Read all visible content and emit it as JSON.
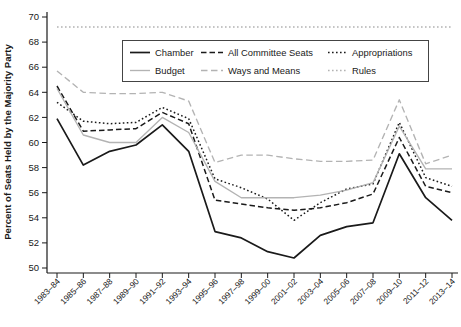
{
  "chart_data": {
    "type": "line",
    "title": "",
    "xlabel": "",
    "ylabel": "Percent of Seats Held by the Majority Party",
    "ylim": [
      50,
      70
    ],
    "yticks": [
      50,
      52,
      54,
      56,
      58,
      60,
      62,
      64,
      66,
      68,
      70
    ],
    "grid": false,
    "legend_position": "top-center-boxed",
    "categories": [
      "1983–84",
      "1985–86",
      "1987–88",
      "1989–90",
      "1991–92",
      "1993–94",
      "1995–96",
      "1997–98",
      "1999–00",
      "2001–02",
      "2003–04",
      "2005–06",
      "2007–08",
      "2009–10",
      "2011–12",
      "2013–14"
    ],
    "series": [
      {
        "name": "Chamber",
        "color": "#1a1a1a",
        "style": "solid",
        "values": [
          61.9,
          58.2,
          59.3,
          59.8,
          61.4,
          59.3,
          52.9,
          52.4,
          51.3,
          50.8,
          52.6,
          53.3,
          53.6,
          59.1,
          55.6,
          53.8
        ]
      },
      {
        "name": "All Committee Seats",
        "color": "#1a1a1a",
        "style": "dashed",
        "values": [
          64.5,
          60.9,
          61.0,
          61.1,
          62.4,
          61.5,
          55.4,
          55.1,
          54.8,
          54.6,
          54.8,
          55.2,
          55.9,
          60.4,
          56.5,
          56.0
        ]
      },
      {
        "name": "Appropriations",
        "color": "#1a1a1a",
        "style": "dotted",
        "values": [
          63.2,
          61.7,
          61.5,
          61.6,
          62.8,
          61.9,
          57.1,
          56.4,
          55.5,
          53.8,
          55.2,
          56.3,
          56.7,
          61.6,
          57.2,
          56.5
        ]
      },
      {
        "name": "Budget",
        "color": "#b3b3b3",
        "style": "solid",
        "values": [
          64.3,
          60.6,
          60.0,
          60.0,
          62.0,
          60.8,
          56.9,
          55.6,
          55.6,
          55.6,
          55.8,
          56.2,
          56.8,
          61.3,
          57.9,
          57.9
        ]
      },
      {
        "name": "Ways and Means",
        "color": "#b3b3b3",
        "style": "dashed",
        "values": [
          65.7,
          64.0,
          63.9,
          63.9,
          64.0,
          63.3,
          58.4,
          59.0,
          59.0,
          58.7,
          58.5,
          58.5,
          58.6,
          63.4,
          58.3,
          59.0
        ]
      },
      {
        "name": "Rules",
        "color": "#b3b3b3",
        "style": "dotted",
        "values": [
          69.2,
          69.2,
          69.2,
          69.2,
          69.2,
          69.2,
          69.2,
          69.2,
          69.2,
          69.2,
          69.2,
          69.2,
          69.2,
          69.2,
          69.2,
          69.2
        ]
      }
    ],
    "legend_order": [
      [
        "Chamber",
        "All Committee Seats",
        "Appropriations"
      ],
      [
        "Budget",
        "Ways and Means",
        "Rules"
      ]
    ]
  }
}
